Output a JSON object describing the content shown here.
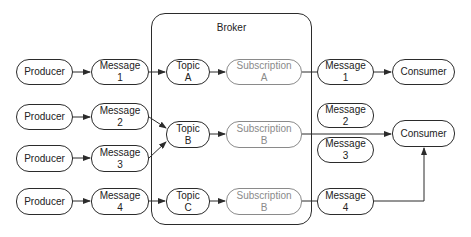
{
  "broker": {
    "label": "Broker"
  },
  "producers": [
    {
      "label": "Producer"
    },
    {
      "label": "Producer"
    },
    {
      "label": "Producer"
    },
    {
      "label": "Producer"
    }
  ],
  "messages_in": [
    {
      "line1": "Message",
      "line2": "1"
    },
    {
      "line1": "Message",
      "line2": "2"
    },
    {
      "line1": "Message",
      "line2": "3"
    },
    {
      "line1": "Message",
      "line2": "4"
    }
  ],
  "topics": [
    {
      "line1": "Topic",
      "line2": "A"
    },
    {
      "line1": "Topic",
      "line2": "B"
    },
    {
      "line1": "Topic",
      "line2": "C"
    }
  ],
  "subscriptions": [
    {
      "line1": "Subscription",
      "line2": "A"
    },
    {
      "line1": "Subscription",
      "line2": "B"
    },
    {
      "line1": "Subscription",
      "line2": "B"
    }
  ],
  "messages_out": [
    {
      "line1": "Message",
      "line2": "1"
    },
    {
      "line1": "Message",
      "line2": "2"
    },
    {
      "line1": "Message",
      "line2": "3"
    },
    {
      "line1": "Message",
      "line2": "4"
    }
  ],
  "consumers": [
    {
      "label": "Consumer"
    },
    {
      "label": "Consumer"
    }
  ],
  "colors": {
    "stroke": "#2b2b2b",
    "faded": "#8a8a8a"
  }
}
